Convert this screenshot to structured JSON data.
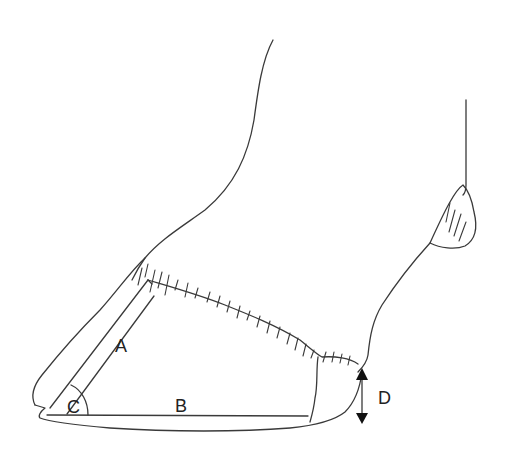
{
  "diagram": {
    "labels": {
      "a": "A",
      "b": "B",
      "c": "C",
      "d": "D"
    },
    "colors": {
      "line": "#3a3a3a",
      "background": "#ffffff"
    }
  }
}
